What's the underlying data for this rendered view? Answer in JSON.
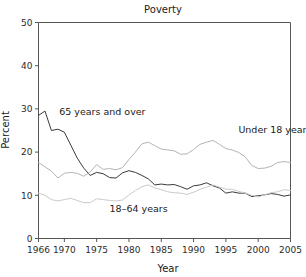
{
  "chart_data": {
    "type": "line",
    "title": "Poverty",
    "xlabel": "Year",
    "ylabel": "Percent",
    "xlim": [
      1966,
      2005
    ],
    "ylim": [
      0,
      50
    ],
    "grid": false,
    "legend": "inline-annotations",
    "xticks": [
      1966,
      1970,
      1975,
      1980,
      1985,
      1990,
      1995,
      2000,
      2005
    ],
    "xtick_labels": [
      "1966",
      "1970",
      "1975",
      "1980",
      "1985",
      "1990",
      "1995",
      "2000",
      "2005"
    ],
    "yticks": [
      0,
      10,
      20,
      30,
      40,
      50
    ],
    "ytick_labels": [
      "0",
      "10",
      "20",
      "30",
      "40",
      "50"
    ],
    "x": [
      1966,
      1967,
      1968,
      1969,
      1970,
      1971,
      1972,
      1973,
      1974,
      1975,
      1976,
      1977,
      1978,
      1979,
      1980,
      1981,
      1982,
      1983,
      1984,
      1985,
      1986,
      1987,
      1988,
      1989,
      1990,
      1991,
      1992,
      1993,
      1994,
      1995,
      1996,
      1997,
      1998,
      1999,
      2000,
      2001,
      2002,
      2003,
      2004,
      2005
    ],
    "series": [
      {
        "name": "65 years and over",
        "color": "#3a3a3a",
        "label_x": 1969.2,
        "label_y": 28.6,
        "values": [
          28.5,
          29.5,
          25.0,
          25.3,
          24.6,
          21.6,
          18.6,
          16.3,
          14.6,
          15.3,
          15.0,
          14.1,
          14.0,
          15.2,
          15.7,
          15.3,
          14.6,
          13.8,
          12.4,
          12.6,
          12.4,
          12.5,
          12.0,
          11.4,
          12.2,
          12.4,
          12.9,
          12.2,
          11.7,
          10.5,
          10.8,
          10.5,
          10.5,
          9.7,
          9.9,
          10.1,
          10.4,
          10.2,
          9.8,
          10.1
        ]
      },
      {
        "name": "Under 18 years",
        "color": "#b4b4b4",
        "label_x": 1994.0,
        "label_y": 24.4,
        "values": [
          17.6,
          16.6,
          15.6,
          14.0,
          15.1,
          15.3,
          15.1,
          14.4,
          15.4,
          17.1,
          16.0,
          16.2,
          15.9,
          16.4,
          18.3,
          20.0,
          21.9,
          22.3,
          21.5,
          20.7,
          20.5,
          20.3,
          19.5,
          19.6,
          20.6,
          21.8,
          22.3,
          22.7,
          21.8,
          20.8,
          20.5,
          19.9,
          18.9,
          16.9,
          16.2,
          16.3,
          16.7,
          17.6,
          17.8,
          17.6
        ]
      },
      {
        "name": "18–64 years",
        "color": "#cacaca",
        "label_x": 1977.0,
        "label_y": 6.2,
        "values": [
          10.5,
          10.0,
          9.0,
          8.7,
          9.0,
          9.3,
          8.8,
          8.3,
          8.3,
          9.2,
          9.0,
          8.8,
          8.7,
          8.9,
          10.1,
          11.1,
          12.0,
          12.4,
          11.7,
          11.3,
          10.8,
          10.6,
          10.5,
          10.2,
          10.7,
          11.4,
          11.9,
          12.4,
          11.9,
          11.4,
          11.4,
          10.9,
          10.5,
          10.0,
          9.6,
          10.1,
          10.6,
          10.8,
          11.3,
          11.1
        ]
      }
    ]
  },
  "figure": {
    "background": "#ffffff",
    "axis_color": "#555555"
  }
}
